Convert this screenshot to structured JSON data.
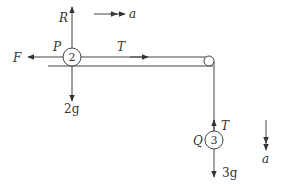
{
  "diagram": {
    "particle_p": {
      "name": "P",
      "mass": "2",
      "weight": "2g"
    },
    "particle_q": {
      "name": "Q",
      "mass": "3",
      "weight": "3g"
    },
    "forces": {
      "reaction": "R",
      "friction": "F",
      "tension_horizontal": "T",
      "tension_vertical": "T"
    },
    "acceleration_horizontal": "a",
    "acceleration_vertical": "a"
  }
}
